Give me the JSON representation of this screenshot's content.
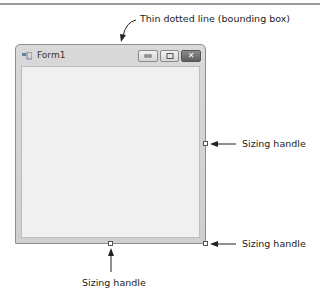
{
  "window": {
    "title": "Form1",
    "controls": [
      "minimize",
      "maximize",
      "close"
    ],
    "icon": "form-icon"
  },
  "annotations": {
    "bounding_box": "Thin dotted line (bounding box)",
    "handle_right": "Sizing handle",
    "handle_corner": "Sizing handle",
    "handle_bottom": "Sizing handle"
  }
}
